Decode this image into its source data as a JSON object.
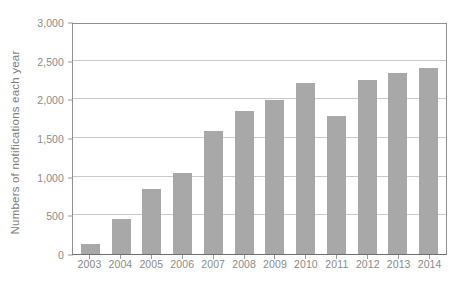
{
  "chart_data": {
    "type": "bar",
    "title": "",
    "subtitle": "",
    "xlabel": "",
    "ylabel": "Numbers of notifications each year",
    "categories": [
      "2003",
      "2004",
      "2005",
      "2006",
      "2007",
      "2008",
      "2009",
      "2010",
      "2011",
      "2012",
      "2013",
      "2014"
    ],
    "values": [
      130,
      450,
      840,
      1050,
      1590,
      1850,
      1990,
      2210,
      1790,
      2250,
      2340,
      2400
    ],
    "ylim": [
      0,
      3000
    ],
    "ytick_values": [
      0,
      500,
      1000,
      1500,
      2000,
      2500,
      3000
    ],
    "ytick_labels": [
      "0",
      "500",
      "1,000",
      "1,500",
      "2,000",
      "2,500",
      "3,000"
    ],
    "grid": true,
    "grid_axis": "y",
    "legend": false,
    "legend_position": "none",
    "bar_color": "#a8a8a8",
    "gridline_color": "#c9c9c9",
    "axis_color": "#8f8f8f",
    "text_color": "#8a8a8a",
    "background_color": "#ffffff"
  }
}
